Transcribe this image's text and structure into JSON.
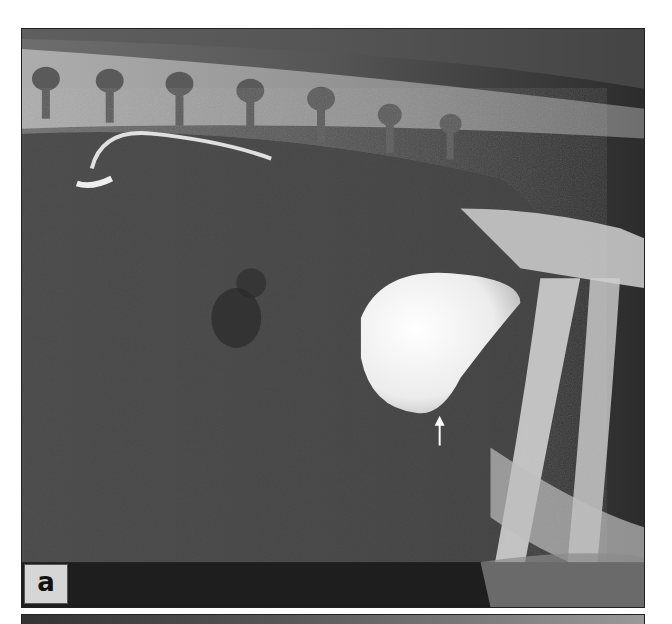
{
  "figure": {
    "panel_label": "a",
    "image_type": "lateral abdominal radiograph",
    "annotation": "white-arrow-pointing-up",
    "colors": {
      "background": "#ffffff",
      "border": "#222222",
      "label_box": "#d6d6d6",
      "label_text": "#111111"
    }
  }
}
